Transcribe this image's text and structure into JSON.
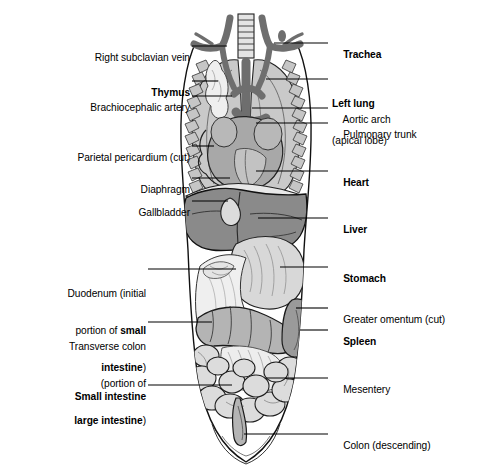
{
  "figure": {
    "type": "anatomical-illustration",
    "background_color": "#ffffff",
    "line_color": "#000000",
    "palette": {
      "lung": "#c9c9c9",
      "liver": "#8a8a8a",
      "heart": "#a8a8a8",
      "vessel": "#6e6e6e",
      "stomach": "#d8d8d8",
      "intestine": "#dcdcdc",
      "spleen": "#9a9a9a",
      "omentum": "#efefef",
      "colon": "#b4b4b4",
      "rib": "#bdbdbd"
    }
  },
  "labels_left": [
    {
      "id": "right-subclavian-vein",
      "lines": [
        {
          "text": "Right subclavian vein",
          "bold": false
        }
      ]
    },
    {
      "id": "thymus",
      "lines": [
        {
          "text": "Thymus",
          "bold": true
        }
      ]
    },
    {
      "id": "brachiocephalic-artery",
      "lines": [
        {
          "text": "Brachiocephalic artery",
          "bold": false
        }
      ]
    },
    {
      "id": "parietal-pericardium",
      "lines": [
        {
          "text": "Parietal pericardium (cut)",
          "bold": false
        }
      ]
    },
    {
      "id": "diaphragm",
      "lines": [
        {
          "text": "Diaphragm",
          "bold": false
        }
      ]
    },
    {
      "id": "gallbladder",
      "lines": [
        {
          "text": "Gallbladder",
          "bold": false
        }
      ]
    },
    {
      "id": "duodenum",
      "lines": [
        {
          "text": "Duodenum (initial",
          "bold": false
        },
        {
          "text": "portion of ",
          "bold": false,
          "tail": "small",
          "tail_bold": true
        },
        {
          "text": "intestine",
          "bold": true,
          "tail": ")",
          "tail_bold": false
        }
      ]
    },
    {
      "id": "transverse-colon",
      "lines": [
        {
          "text": "Transverse colon",
          "bold": false
        },
        {
          "text": "(portion of",
          "bold": false
        },
        {
          "text": "large intestine",
          "bold": true,
          "tail": ")",
          "tail_bold": false
        }
      ]
    },
    {
      "id": "small-intestine",
      "lines": [
        {
          "text": "Small intestine",
          "bold": true
        }
      ]
    }
  ],
  "labels_right": [
    {
      "id": "trachea",
      "lines": [
        {
          "text": "Trachea",
          "bold": true
        }
      ]
    },
    {
      "id": "left-lung",
      "lines": [
        {
          "text": "Left lung",
          "bold": true
        },
        {
          "text": "(apical lobe)",
          "bold": false
        }
      ]
    },
    {
      "id": "aortic-arch",
      "lines": [
        {
          "text": "Aortic arch",
          "bold": false
        }
      ]
    },
    {
      "id": "pulmonary-trunk",
      "lines": [
        {
          "text": "Pulmonary trunk",
          "bold": false
        }
      ]
    },
    {
      "id": "heart",
      "lines": [
        {
          "text": "Heart",
          "bold": true
        }
      ]
    },
    {
      "id": "liver",
      "lines": [
        {
          "text": "Liver",
          "bold": true
        }
      ]
    },
    {
      "id": "stomach",
      "lines": [
        {
          "text": "Stomach",
          "bold": true
        }
      ]
    },
    {
      "id": "greater-omentum",
      "lines": [
        {
          "text": "Greater omentum (cut)",
          "bold": false
        }
      ]
    },
    {
      "id": "spleen",
      "lines": [
        {
          "text": "Spleen",
          "bold": true
        }
      ]
    },
    {
      "id": "mesentery",
      "lines": [
        {
          "text": "Mesentery",
          "bold": false
        }
      ]
    },
    {
      "id": "colon-descending",
      "lines": [
        {
          "text": "Colon (descending)",
          "bold": false
        }
      ]
    }
  ],
  "label_text": {
    "right_subclavian_vein": "Right subclavian vein",
    "thymus": "Thymus",
    "brachiocephalic_artery": "Brachiocephalic artery",
    "parietal_pericardium": "Parietal pericardium (cut)",
    "diaphragm": "Diaphragm",
    "gallbladder": "Gallbladder",
    "duodenum_l1": "Duodenum (initial",
    "duodenum_l2a": "portion of ",
    "duodenum_l2b": "small",
    "duodenum_l3a": "intestine",
    "duodenum_l3b": ")",
    "transverse_colon_l1": "Transverse colon",
    "transverse_colon_l2": "(portion of",
    "transverse_colon_l3a": "large intestine",
    "transverse_colon_l3b": ")",
    "small_intestine": "Small intestine",
    "trachea": "Trachea",
    "left_lung_l1": "Left lung",
    "left_lung_l2": "(apical lobe)",
    "aortic_arch": "Aortic arch",
    "pulmonary_trunk": "Pulmonary trunk",
    "heart": "Heart",
    "liver": "Liver",
    "stomach": "Stomach",
    "greater_omentum": "Greater omentum (cut)",
    "spleen": "Spleen",
    "mesentery": "Mesentery",
    "colon_descending": "Colon (descending)"
  }
}
